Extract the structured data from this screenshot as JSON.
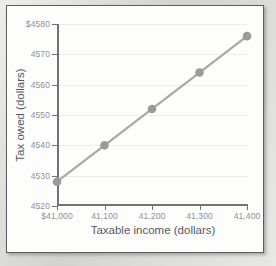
{
  "figure": {
    "background_color": "#fdfdfc",
    "frame_color": "#5b5f62",
    "series_color": "#a8a8a8",
    "marker_color": "#9a9a9a",
    "axis_color": "#6e7376",
    "grid_color": "#ededea",
    "tick_label_color": "#8d9093",
    "axis_title_color": "#55585b"
  },
  "chart_data": {
    "type": "line",
    "title": "",
    "subtitle": "",
    "xlabel": "Taxable income (dollars)",
    "ylabel": "Tax owed (dollars)",
    "x": [
      41000,
      41100,
      41200,
      41300,
      41400
    ],
    "values": [
      4528,
      4540,
      4552,
      4564,
      4576
    ],
    "series": [
      {
        "name": "Tax owed",
        "x": [
          41000,
          41100,
          41200,
          41300,
          41400
        ],
        "values": [
          4528,
          4540,
          4552,
          4564,
          4576
        ]
      }
    ],
    "xlim": [
      41000,
      41400
    ],
    "ylim": [
      4520,
      4580
    ],
    "xticks": [
      41000,
      41100,
      41200,
      41300,
      41400
    ],
    "yticks": [
      4520,
      4530,
      4540,
      4550,
      4560,
      4570,
      4580
    ],
    "xtick_labels": [
      "$41,000",
      "41,100",
      "41,200",
      "41,300",
      "41,400"
    ],
    "ytick_labels": [
      "4520",
      "4530",
      "4540",
      "4550",
      "4560",
      "4570",
      "$4580"
    ],
    "grid": true,
    "grid_axis": "y",
    "legend": false,
    "legend_position": "none",
    "markers": true,
    "marker_shape": "circle",
    "annotations": []
  }
}
